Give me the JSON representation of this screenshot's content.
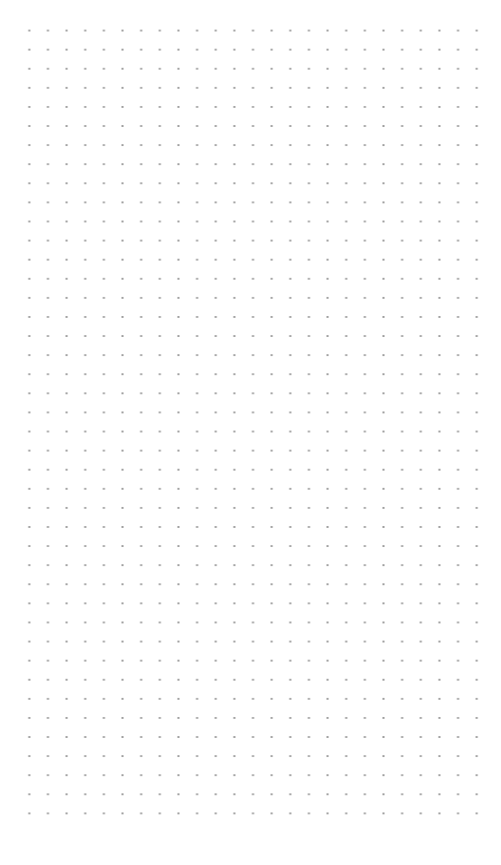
{
  "page": {
    "type": "dot-grid-paper",
    "background_color": "#ffffff",
    "dot_color": "#9c9c9c",
    "grid": {
      "columns": 25,
      "rows": 42,
      "spacing_x_px": 18.65,
      "spacing_y_px": 19.1
    }
  }
}
